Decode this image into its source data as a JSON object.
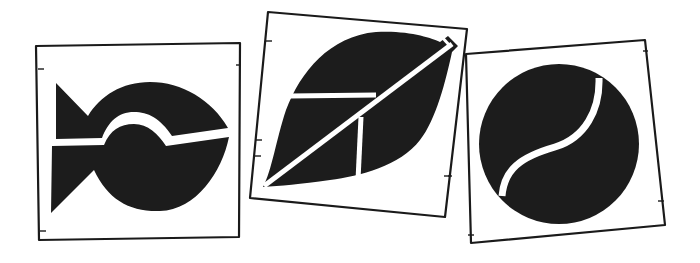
{
  "scene": {
    "description": "Three hand-drawn square cards, each containing a black pictogram",
    "background_color": "#ffffff",
    "ink_color": "#1c1c1c"
  },
  "cards": [
    {
      "id": "fish",
      "icon": "fish-icon",
      "label": ""
    },
    {
      "id": "leaf",
      "icon": "leaf-icon",
      "label": ""
    },
    {
      "id": "ball",
      "icon": "ball-icon",
      "label": ""
    }
  ]
}
